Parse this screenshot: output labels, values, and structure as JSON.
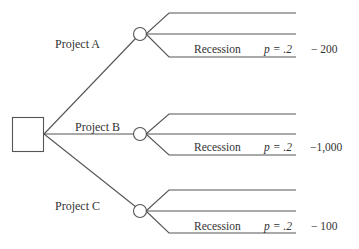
{
  "diagram": {
    "type": "decision-tree",
    "decision_node": {
      "shape": "square"
    },
    "colors": {
      "line": "#555555",
      "text": "#333333",
      "background": "#ffffff"
    },
    "projects": [
      {
        "label": "Project A",
        "outcome_label": "Recession",
        "probability": "p = .2",
        "payoff": "−  200"
      },
      {
        "label": "Project B",
        "outcome_label": "Recession",
        "probability": "p = .2",
        "payoff": "−1,000"
      },
      {
        "label": "Project C",
        "outcome_label": "Recession",
        "probability": "p = .2",
        "payoff": "−  100"
      }
    ]
  }
}
